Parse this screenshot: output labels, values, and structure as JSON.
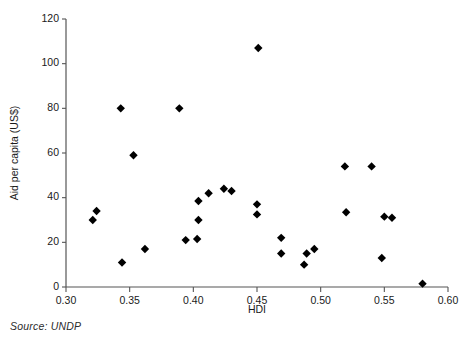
{
  "chart_data": {
    "type": "scatter",
    "title": "",
    "xlabel": "HDI",
    "ylabel": "Aid per capita (US$)",
    "xlim": [
      0.3,
      0.6
    ],
    "ylim": [
      0,
      120
    ],
    "xticks": [
      0.3,
      0.35,
      0.4,
      0.45,
      0.5,
      0.55,
      0.6
    ],
    "xtick_labels": [
      "0.30",
      "0.35",
      "0.40",
      "0.45",
      "0.50",
      "0.55",
      "0.60"
    ],
    "yticks": [
      0,
      20,
      40,
      60,
      80,
      100,
      120
    ],
    "ytick_labels": [
      "0",
      "20",
      "40",
      "60",
      "80",
      "100",
      "120"
    ],
    "grid": false,
    "legend": null,
    "marker": "diamond",
    "marker_color": "#000000",
    "points": [
      {
        "x": 0.321,
        "y": 30
      },
      {
        "x": 0.324,
        "y": 34
      },
      {
        "x": 0.343,
        "y": 80
      },
      {
        "x": 0.344,
        "y": 11
      },
      {
        "x": 0.353,
        "y": 59
      },
      {
        "x": 0.362,
        "y": 17
      },
      {
        "x": 0.389,
        "y": 80
      },
      {
        "x": 0.394,
        "y": 21
      },
      {
        "x": 0.403,
        "y": 21.5
      },
      {
        "x": 0.404,
        "y": 30
      },
      {
        "x": 0.404,
        "y": 38.5
      },
      {
        "x": 0.412,
        "y": 42
      },
      {
        "x": 0.424,
        "y": 44
      },
      {
        "x": 0.43,
        "y": 43
      },
      {
        "x": 0.45,
        "y": 32.5
      },
      {
        "x": 0.45,
        "y": 37
      },
      {
        "x": 0.451,
        "y": 107
      },
      {
        "x": 0.469,
        "y": 15
      },
      {
        "x": 0.469,
        "y": 22
      },
      {
        "x": 0.487,
        "y": 10
      },
      {
        "x": 0.489,
        "y": 15
      },
      {
        "x": 0.495,
        "y": 17
      },
      {
        "x": 0.519,
        "y": 54
      },
      {
        "x": 0.52,
        "y": 33.5
      },
      {
        "x": 0.54,
        "y": 54
      },
      {
        "x": 0.548,
        "y": 13
      },
      {
        "x": 0.55,
        "y": 31.5
      },
      {
        "x": 0.556,
        "y": 31
      },
      {
        "x": 0.58,
        "y": 1.5
      }
    ]
  },
  "source_note": "Source: UNDP"
}
